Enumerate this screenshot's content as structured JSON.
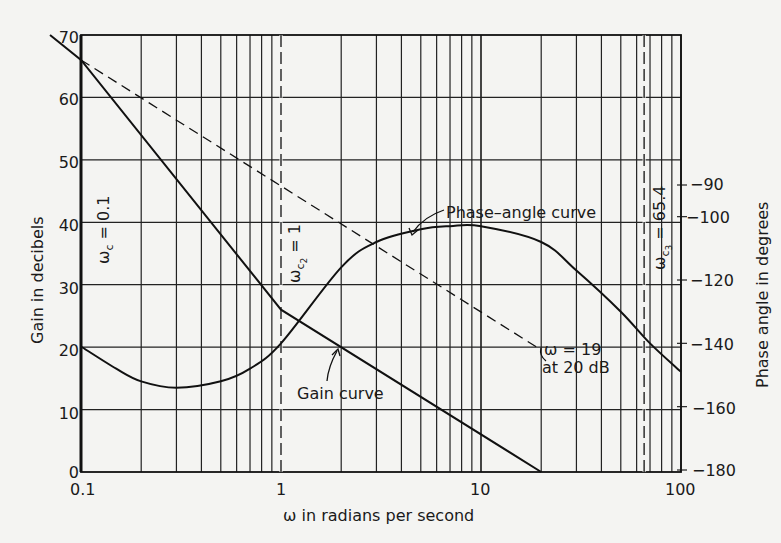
{
  "chart_data": {
    "type": "line",
    "title": "",
    "xlabel": "ω in radians per second",
    "ylabel": "Gain in decibels",
    "ylabel_right": "Phase angle in degrees",
    "xscale": "log",
    "xlim": [
      0.1,
      100
    ],
    "ylim": [
      0,
      70
    ],
    "ylim_right": [
      -180,
      -90
    ],
    "grid": true,
    "x_ticks": [
      "0.1",
      "1",
      "10",
      "100"
    ],
    "y_ticks": [
      "0",
      "10",
      "20",
      "30",
      "40",
      "50",
      "60",
      "70"
    ],
    "y_right_ticks": [
      "-90",
      "-100",
      "-120",
      "-140",
      "-160",
      "-180"
    ],
    "series": [
      {
        "name": "Gain curve",
        "style": "solid",
        "axis": "left",
        "x": [
          0.07,
          0.1,
          1,
          20
        ],
        "y": [
          70,
          66,
          26,
          0
        ]
      },
      {
        "name": "Asymptote",
        "style": "dashed",
        "axis": "left",
        "x": [
          0.1,
          19
        ],
        "y": [
          66,
          20
        ]
      },
      {
        "name": "Phase-angle curve",
        "style": "solid",
        "axis": "right",
        "x": [
          0.1,
          0.15,
          0.2,
          0.3,
          0.5,
          0.7,
          1,
          2,
          3,
          5,
          7,
          10,
          20,
          30,
          50,
          70,
          100
        ],
        "y": [
          -141,
          -148,
          -152,
          -154,
          -152,
          -148,
          -140,
          -116,
          -108,
          -104,
          -103,
          -103,
          -108,
          -117,
          -130,
          -140,
          -149
        ]
      }
    ],
    "annotations": [
      {
        "text": "Phase-angle curve",
        "x": 4,
        "y_deg": -104
      },
      {
        "text": "Gain curve",
        "x": 2,
        "y_db": 20
      },
      {
        "text": "ω = 19",
        "x": 19,
        "y_db": 20
      },
      {
        "text": "at 20 dB",
        "x": 19,
        "y_db": 20
      },
      {
        "text": "ω_c = 0.1",
        "x": 0.1,
        "vertical": true
      },
      {
        "text": "ω_c2 = 1",
        "x": 1,
        "vertical": true
      },
      {
        "text": "ω_c3 = 65.4",
        "x": 65.4,
        "vertical": true
      }
    ]
  },
  "labels": {
    "xlabel": "ω in radians per second",
    "ylabel": "Gain in decibels",
    "ylabel_right": "Phase angle in degrees",
    "phase_curve": "Phase–angle curve",
    "gain_curve": "Gain curve",
    "omega19": "ω = 19",
    "at20db": "at 20 dB",
    "wc1_sym": "ω",
    "wc1_sub": "c",
    "wc1_val": " = 0.1",
    "wc2_sym": "ω",
    "wc2_sub": "c",
    "wc2_subsub": "2",
    "wc2_val": " = 1",
    "wc3_sym": "ω",
    "wc3_sub": "c",
    "wc3_subsub": "3",
    "wc3_val": " = 65.4"
  },
  "ticks": {
    "x": [
      "0.1",
      "1",
      "10",
      "100"
    ],
    "y": [
      "0",
      "10",
      "20",
      "30",
      "40",
      "50",
      "60",
      "70"
    ],
    "yr": [
      "−90",
      "−100",
      "−120",
      "−140",
      "−160",
      "−180"
    ]
  }
}
